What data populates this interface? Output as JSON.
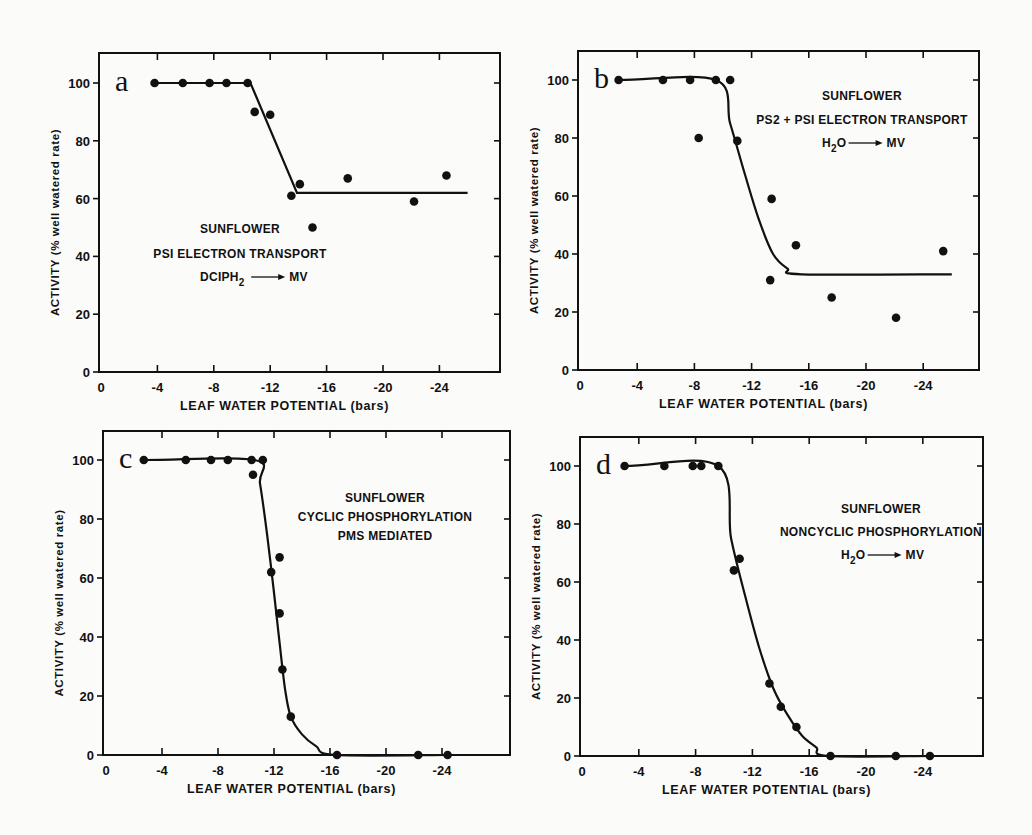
{
  "figure": {
    "panels": [
      {
        "letter": "a",
        "annotation": [
          "SUNFLOWER",
          "PSI ELECTRON TRANSPORT",
          "DCIPH2 → MV"
        ]
      },
      {
        "letter": "b",
        "annotation": [
          "SUNFLOWER",
          "PS2 + PSI ELECTRON TRANSPORT",
          "H2O → MV"
        ]
      },
      {
        "letter": "c",
        "annotation": [
          "SUNFLOWER",
          "CYCLIC PHOSPHORYLATION",
          "PMS MEDIATED"
        ]
      },
      {
        "letter": "d",
        "annotation": [
          "SUNFLOWER",
          "NONCYCLIC PHOSPHORYLATION",
          "H2O → MV"
        ]
      }
    ],
    "xlabel": "LEAF WATER POTENTIAL (bars)",
    "ylabel": "ACTIVITY (% well watered rate)",
    "x_ticks": [
      "0",
      "-4",
      "-8",
      "-12",
      "-16",
      "-20",
      "-24"
    ],
    "y_ticks": [
      "0",
      "20",
      "40",
      "60",
      "80",
      "100"
    ],
    "colors": {
      "ink": "#111111",
      "paper": "#fbfbf9"
    }
  },
  "chart_data": [
    {
      "type": "scatter",
      "panel": "a",
      "title": "SUNFLOWER PSI ELECTRON TRANSPORT DCIPH2 → MV",
      "xlabel": "LEAF WATER POTENTIAL (bars)",
      "ylabel": "ACTIVITY (% well watered rate)",
      "xlim": [
        0,
        -28
      ],
      "ylim": [
        0,
        110
      ],
      "x_ticks": [
        0,
        -4,
        -8,
        -12,
        -16,
        -20,
        -24
      ],
      "y_ticks": [
        0,
        20,
        40,
        60,
        80,
        100
      ],
      "grid": false,
      "points": {
        "x": [
          -3.8,
          -5.8,
          -7.7,
          -8.9,
          -10.4,
          -10.9,
          -12.0,
          -13.5,
          -14.1,
          -15.0,
          -17.5,
          -22.2,
          -24.5
        ],
        "y": [
          100,
          100,
          100,
          100,
          100,
          90,
          89,
          61,
          65,
          50,
          67,
          59,
          68
        ]
      },
      "fit_line": {
        "x": [
          -3.8,
          -10.6,
          -13.9,
          -26.0
        ],
        "y": [
          100,
          100,
          62,
          62
        ]
      }
    },
    {
      "type": "scatter",
      "panel": "b",
      "title": "SUNFLOWER PS2 + PSI ELECTRON TRANSPORT H2O → MV",
      "xlabel": "LEAF WATER POTENTIAL (bars)",
      "ylabel": "ACTIVITY (% well watered rate)",
      "xlim": [
        0,
        -28
      ],
      "ylim": [
        0,
        110
      ],
      "x_ticks": [
        0,
        -4,
        -8,
        -12,
        -16,
        -20,
        -24
      ],
      "y_ticks": [
        0,
        20,
        40,
        60,
        80,
        100
      ],
      "grid": false,
      "points": {
        "x": [
          -2.7,
          -5.8,
          -7.7,
          -8.3,
          -9.5,
          -10.5,
          -11.0,
          -13.3,
          -13.4,
          -15.1,
          -17.6,
          -22.1,
          -25.4
        ],
        "y": [
          100,
          100,
          100,
          80,
          100,
          100,
          79,
          31,
          59,
          43,
          25,
          18,
          41
        ]
      },
      "fit_line": {
        "x": [
          -2.7,
          -9.5,
          -10.5,
          -11.5,
          -12.5,
          -13.5,
          -14.5,
          -15.5,
          -26.0
        ],
        "y": [
          100,
          100,
          85,
          68,
          52,
          40,
          35,
          33,
          33
        ]
      }
    },
    {
      "type": "scatter",
      "panel": "c",
      "title": "SUNFLOWER CYCLIC PHOSPHORYLATION PMS MEDIATED",
      "xlabel": "LEAF WATER POTENTIAL (bars)",
      "ylabel": "ACTIVITY (% well watered rate)",
      "xlim": [
        0,
        -28
      ],
      "ylim": [
        0,
        110
      ],
      "x_ticks": [
        0,
        -4,
        -8,
        -12,
        -16,
        -20,
        -24
      ],
      "y_ticks": [
        0,
        20,
        40,
        60,
        80,
        100
      ],
      "grid": false,
      "points": {
        "x": [
          -2.7,
          -5.7,
          -7.5,
          -8.7,
          -10.4,
          -10.5,
          -11.2,
          -11.8,
          -12.4,
          -12.4,
          -12.6,
          -13.2,
          -16.5,
          -22.3,
          -24.4
        ],
        "y": [
          100,
          100,
          100,
          100,
          100,
          95,
          100,
          62,
          67,
          48,
          29,
          13,
          0,
          0,
          0
        ]
      },
      "fit_line": {
        "x": [
          -2.7,
          -10.6,
          -11.0,
          -11.5,
          -12.0,
          -12.4,
          -12.8,
          -13.2,
          -14.0,
          -15.0,
          -16.4,
          -24.4
        ],
        "y": [
          100,
          100,
          92,
          75,
          55,
          38,
          22,
          13,
          7,
          3,
          0,
          0
        ]
      }
    },
    {
      "type": "scatter",
      "panel": "d",
      "title": "SUNFLOWER NONCYCLIC PHOSPHORYLATION H2O → MV",
      "xlabel": "LEAF WATER POTENTIAL (bars)",
      "ylabel": "ACTIVITY (% well watered rate)",
      "xlim": [
        0,
        -28
      ],
      "ylim": [
        0,
        110
      ],
      "x_ticks": [
        0,
        -4,
        -8,
        -12,
        -16,
        -20,
        -24
      ],
      "y_ticks": [
        0,
        20,
        40,
        60,
        80,
        100
      ],
      "grid": false,
      "points": {
        "x": [
          -3.0,
          -5.8,
          -7.8,
          -8.4,
          -9.6,
          -10.7,
          -11.1,
          -13.2,
          -14.0,
          -15.1,
          -17.5,
          -22.1,
          -24.5
        ],
        "y": [
          100,
          100,
          100,
          100,
          100,
          64,
          68,
          25,
          17,
          10,
          0,
          0,
          0
        ]
      },
      "fit_line": {
        "x": [
          -3.0,
          -9.6,
          -10.5,
          -11.5,
          -12.5,
          -13.5,
          -14.5,
          -15.5,
          -16.5,
          -17.3,
          -24.5
        ],
        "y": [
          100,
          100,
          75,
          55,
          37,
          23,
          14,
          7,
          3,
          0,
          0
        ]
      }
    }
  ]
}
